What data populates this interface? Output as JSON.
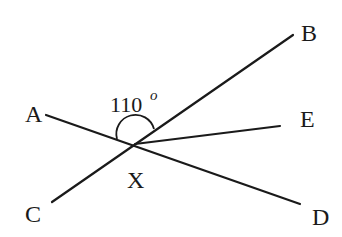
{
  "diagram": {
    "type": "geometry-angles",
    "points": {
      "A": {
        "label": "A"
      },
      "B": {
        "label": "B"
      },
      "C": {
        "label": "C"
      },
      "D": {
        "label": "D"
      },
      "E": {
        "label": "E"
      },
      "X": {
        "label": "X"
      }
    },
    "lines": [
      {
        "name": "AD",
        "from": "A",
        "to": "D",
        "through": "X"
      },
      {
        "name": "CB",
        "from": "C",
        "to": "B",
        "through": "X"
      },
      {
        "name": "XE",
        "from": "X",
        "to": "E"
      }
    ],
    "angle": {
      "vertex": "X",
      "between": [
        "A",
        "B"
      ],
      "value": "110",
      "unit": "o",
      "text": "110°"
    },
    "colors": {
      "stroke": "#1a1a1a",
      "background": "#ffffff"
    }
  }
}
